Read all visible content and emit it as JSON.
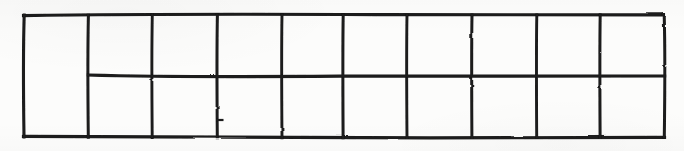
{
  "figure": {
    "medium": "ink on paper, scanned",
    "background_color": "#fcfcfb",
    "ink_color": "#1a1a1a",
    "stroke_width": "3"
  },
  "geometry": {
    "image_width": 684,
    "image_height": 151,
    "outer_rect": {
      "left": 23,
      "top": 14,
      "right": 665,
      "bottom": 137,
      "width": 642,
      "height": 123
    },
    "column_count": 10,
    "row_count": 2,
    "vertical_line_x": [
      23,
      88,
      152,
      217,
      282,
      343,
      407,
      472,
      537,
      600,
      665
    ],
    "horizontal_divider": {
      "y": 76,
      "x_start": 88,
      "x_end": 665,
      "spans_columns": "2-10"
    },
    "merged_cell": {
      "column_index": 1,
      "note": "full height, not split"
    },
    "tick_mark": {
      "x": 217,
      "y": 120,
      "length": 5,
      "note": "small stray stub on the 4th vertical line in the lower row"
    }
  },
  "cells": {
    "column_1": {
      "label": "",
      "merged": true,
      "rows": [
        "top-and-bottom"
      ]
    },
    "top_row": [
      "",
      "",
      "",
      "",
      "",
      "",
      "",
      "",
      ""
    ],
    "bottom_row": [
      "",
      "",
      "",
      "",
      "",
      "",
      "",
      "",
      ""
    ]
  },
  "labels": {
    "any_text_present": "none"
  }
}
